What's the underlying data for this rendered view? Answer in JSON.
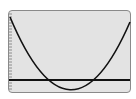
{
  "graph": {
    "type": "calculator-graph-screen",
    "curve": "parabola opening upward",
    "axis": "x-axis horizontal line",
    "y_axis_ticks": "left edge tick marks",
    "colors": {
      "background": "#e3e3e3",
      "frame": "#8a8a8a",
      "curve": "#111111",
      "axis": "#111111"
    }
  }
}
